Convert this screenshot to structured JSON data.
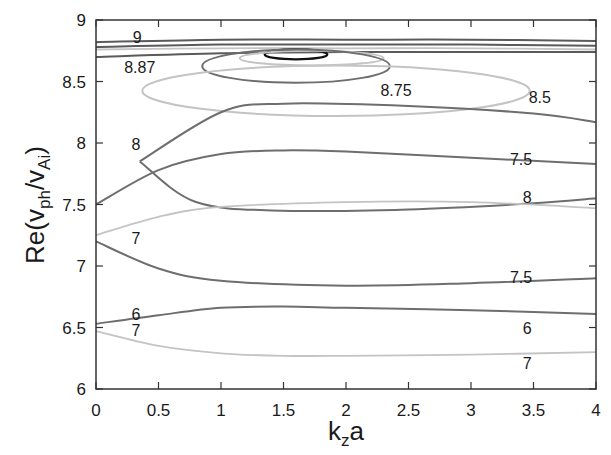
{
  "chart_data": {
    "type": "line",
    "title": "",
    "xlabel": "k_z a",
    "ylabel": "Re(v_ph/v_Ai)",
    "xlim": [
      0,
      4
    ],
    "ylim": [
      6,
      9
    ],
    "grid": false,
    "legend": "none (inline curve labels)",
    "x_ticks": [
      "0",
      "0.5",
      "1",
      "1.5",
      "2",
      "2.5",
      "3",
      "3.5",
      "4"
    ],
    "y_ticks": [
      "6",
      "6.5",
      "7",
      "7.5",
      "8",
      "8.5",
      "9"
    ],
    "series": [
      {
        "name": "9",
        "shade": "dark",
        "x": [
          0,
          1,
          2,
          3,
          4
        ],
        "y": [
          8.82,
          8.84,
          8.84,
          8.84,
          8.83
        ]
      },
      {
        "name": "upper-9-pair",
        "shade": "dark",
        "x": [
          0,
          1,
          2,
          3,
          4
        ],
        "y": [
          8.78,
          8.8,
          8.8,
          8.8,
          8.79
        ]
      },
      {
        "name": "8.87-light",
        "shade": "light",
        "x": [
          0,
          1,
          2,
          3,
          4
        ],
        "y": [
          8.76,
          8.77,
          8.77,
          8.77,
          8.76
        ]
      },
      {
        "name": "8.87",
        "shade": "dark",
        "x": [
          0,
          1,
          2,
          3,
          4
        ],
        "y": [
          8.7,
          8.73,
          8.74,
          8.74,
          8.74
        ]
      },
      {
        "name": "closed-loop-black",
        "shade": "black",
        "x": [
          1.35,
          1.6,
          1.85,
          1.6,
          1.35
        ],
        "y": [
          8.72,
          8.76,
          8.72,
          8.68,
          8.72
        ]
      },
      {
        "name": "closed-loop-light-inner",
        "shade": "light",
        "x": [
          1.15,
          1.6,
          2.3,
          1.6,
          1.15
        ],
        "y": [
          8.7,
          8.75,
          8.7,
          8.63,
          8.7
        ]
      },
      {
        "name": "8.75",
        "shade": "mid",
        "x": [
          0.85,
          1.5,
          2.35,
          1.5,
          0.85
        ],
        "y": [
          8.67,
          8.76,
          8.67,
          8.49,
          8.67
        ]
      },
      {
        "name": "8.5",
        "shade": "light",
        "x": [
          0.37,
          1.5,
          3.47,
          1.5,
          0.37
        ],
        "y": [
          8.38,
          8.63,
          8.38,
          8.22,
          8.38
        ]
      },
      {
        "name": "8 (upper loop branch)",
        "shade": "mid",
        "x": [
          0.35,
          1,
          1.5,
          2.5,
          3.5,
          4
        ],
        "y": [
          7.85,
          8.25,
          8.32,
          8.3,
          8.24,
          8.17
        ]
      },
      {
        "name": "8 (lower loop branch)",
        "shade": "mid",
        "x": [
          0.35,
          0.8,
          1.5,
          2.5,
          3.5,
          4
        ],
        "y": [
          7.85,
          7.52,
          7.45,
          7.46,
          7.51,
          7.55
        ]
      },
      {
        "name": "7.5 (upper)",
        "shade": "mid",
        "x": [
          0,
          0.5,
          1,
          1.5,
          2,
          3,
          4
        ],
        "y": [
          7.5,
          7.78,
          7.91,
          7.94,
          7.93,
          7.88,
          7.83
        ]
      },
      {
        "name": "7 (upper)",
        "shade": "light",
        "x": [
          0,
          0.5,
          1,
          2,
          3,
          4
        ],
        "y": [
          7.25,
          7.4,
          7.48,
          7.52,
          7.52,
          7.47
        ]
      },
      {
        "name": "7.5 (lower)",
        "shade": "mid",
        "x": [
          0,
          0.5,
          1,
          2,
          3,
          4
        ],
        "y": [
          7.2,
          6.98,
          6.88,
          6.84,
          6.86,
          6.9
        ]
      },
      {
        "name": "6",
        "shade": "mid",
        "x": [
          0,
          0.5,
          1,
          1.5,
          2,
          3,
          4
        ],
        "y": [
          6.53,
          6.6,
          6.66,
          6.67,
          6.66,
          6.64,
          6.61
        ]
      },
      {
        "name": "7 (lower)",
        "shade": "light",
        "x": [
          0,
          0.5,
          1,
          1.5,
          2,
          3,
          4
        ],
        "y": [
          6.47,
          6.35,
          6.29,
          6.27,
          6.27,
          6.28,
          6.3
        ]
      }
    ],
    "annotations": [
      {
        "text": "9",
        "x": 0.33,
        "y": 8.86
      },
      {
        "text": "8.87",
        "x": 0.35,
        "y": 8.62
      },
      {
        "text": "8.75",
        "x": 2.4,
        "y": 8.43
      },
      {
        "text": "8.5",
        "x": 3.55,
        "y": 8.37
      },
      {
        "text": "8",
        "x": 0.32,
        "y": 7.99
      },
      {
        "text": "7.5",
        "x": 3.4,
        "y": 7.87
      },
      {
        "text": "8",
        "x": 3.45,
        "y": 7.56
      },
      {
        "text": "7",
        "x": 0.32,
        "y": 7.23
      },
      {
        "text": "7.5",
        "x": 3.4,
        "y": 6.91
      },
      {
        "text": "6",
        "x": 0.32,
        "y": 6.61
      },
      {
        "text": "7",
        "x": 0.32,
        "y": 6.48
      },
      {
        "text": "6",
        "x": 3.45,
        "y": 6.5
      },
      {
        "text": "7",
        "x": 3.45,
        "y": 6.21
      }
    ]
  },
  "axes": {
    "x_label_main": "k",
    "x_label_sub": "z",
    "x_label_tail": "a",
    "y_label_prefix": "Re(v",
    "y_label_sub1": "ph",
    "y_label_mid": "/v",
    "y_label_sub2": "Ai",
    "y_label_suffix": ")"
  },
  "colors": {
    "dark": "#5a5a5a",
    "mid": "#6e6e6e",
    "light": "#c4c4c4",
    "black": "#111111",
    "frame": "#333333"
  }
}
